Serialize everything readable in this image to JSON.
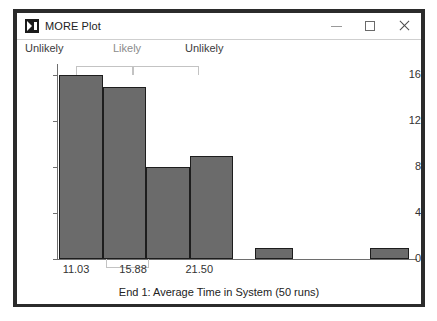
{
  "window": {
    "title": "MORE Plot",
    "icon": "more-plot-app-icon",
    "controls": {
      "minimize": "—",
      "maximize": "□",
      "close": "×"
    }
  },
  "chart_data": {
    "type": "bar",
    "title": "",
    "xlabel": "End 1: Average Time in System (50 runs)",
    "ylabel": "",
    "ylim": [
      0,
      17
    ],
    "xlim": [
      9.5,
      40.0
    ],
    "grid": false,
    "legend": false,
    "yticks": [
      0,
      4,
      8,
      12,
      16
    ],
    "ytick_labels": [
      "0",
      "4",
      "8",
      "12",
      "16"
    ],
    "xticks": [
      11.03,
      15.88,
      21.5
    ],
    "xtick_labels": [
      "11.03",
      "15.88",
      "21.50"
    ],
    "region_labels": [
      {
        "text": "Unlikely",
        "color": "#3c3c3c"
      },
      {
        "text": "Likely",
        "color": "#8b8b8b"
      },
      {
        "text": "Unlikely",
        "color": "#3c3c3c"
      }
    ],
    "bar_color": "#6b6b6b",
    "bar_edge_color": "#1d1d1d",
    "bracket_color": "#c3c3c3",
    "bars": [
      {
        "label": "bin-1",
        "x0": 9.6,
        "x1": 13.3,
        "value": 16
      },
      {
        "label": "bin-2",
        "x0": 13.3,
        "x1": 17.0,
        "value": 15
      },
      {
        "label": "bin-3",
        "x0": 17.0,
        "x1": 20.7,
        "value": 8
      },
      {
        "label": "bin-4",
        "x0": 20.7,
        "x1": 24.4,
        "value": 9
      },
      {
        "label": "bin-5",
        "x0": 26.2,
        "x1": 29.5,
        "value": 1
      },
      {
        "label": "bin-6",
        "x0": 36.0,
        "x1": 39.3,
        "value": 1
      }
    ],
    "brackets": [
      {
        "name": "likely-range-upper",
        "x0": 11.03,
        "x1": 15.88,
        "y0": 16.0,
        "y1": 16.8
      },
      {
        "name": "unlikely-range-upper",
        "x0": 15.88,
        "x1": 21.5,
        "y0": 16.0,
        "y1": 16.8
      },
      {
        "name": "median-range-lower",
        "x0": 13.6,
        "x1": 17.2,
        "y0": -0.75,
        "y1": 0.0
      }
    ]
  }
}
